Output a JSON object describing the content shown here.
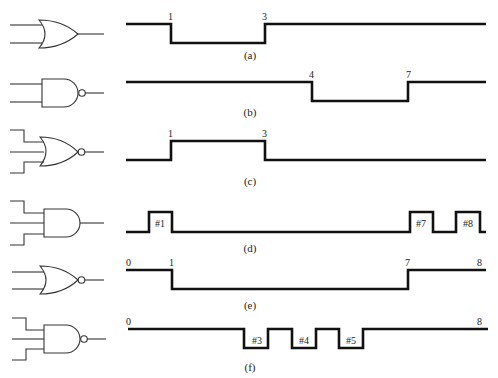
{
  "figure": {
    "rows": [
      {
        "id": "a",
        "gate": "OR",
        "inputs": 2,
        "caption": "(a)",
        "waveform": "high, low from t=1 to t=3, high",
        "time_labels": [
          "1",
          "3"
        ],
        "pulse_labels": []
      },
      {
        "id": "b",
        "gate": "NAND",
        "inputs": 2,
        "caption": "(b)",
        "waveform": "high, low from t=4 to t=7, high",
        "time_labels": [
          "4",
          "7"
        ],
        "pulse_labels": []
      },
      {
        "id": "c",
        "gate": "NOR",
        "inputs": 3,
        "caption": "(c)",
        "waveform": "low, high from t=1 to t=3, low",
        "time_labels": [
          "1",
          "3"
        ],
        "pulse_labels": []
      },
      {
        "id": "d",
        "gate": "AND",
        "inputs": 3,
        "caption": "(d)",
        "waveform": "low with high pulses #1, #7, #8",
        "time_labels": [],
        "pulse_labels": [
          "#1",
          "#7",
          "#8"
        ]
      },
      {
        "id": "e",
        "gate": "NOR",
        "inputs": 2,
        "caption": "(e)",
        "waveform": "high from t=0 to t=1, low until t=7, high to t=8",
        "time_labels": [
          "0",
          "1",
          "7",
          "8"
        ],
        "pulse_labels": []
      },
      {
        "id": "f",
        "gate": "NAND",
        "inputs": 3,
        "caption": "(f)",
        "waveform": "high from t=0 to t=8 with low pulses #3, #4, #5",
        "time_labels": [
          "0",
          "8"
        ],
        "pulse_labels": [
          "#3",
          "#4",
          "#5"
        ]
      }
    ]
  }
}
